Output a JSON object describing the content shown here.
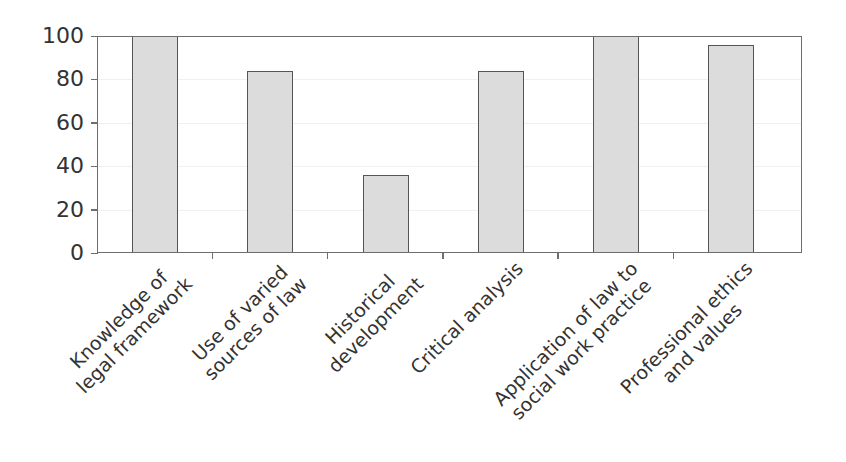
{
  "chart_data": {
    "type": "bar",
    "title": "",
    "xlabel": "",
    "ylabel": "",
    "ylim": [
      0,
      100
    ],
    "yticks": [
      0,
      20,
      40,
      60,
      80,
      100
    ],
    "grid": true,
    "legend": null,
    "categories": [
      "Knowledge of legal framework",
      "Use of varied sources of law",
      "Historical development",
      "Critical analysis",
      "Application of law to social work practice",
      "Professional ethics and values"
    ],
    "category_lines": [
      [
        "Knowledge of",
        "legal framework"
      ],
      [
        "Use of varied",
        "sources of law"
      ],
      [
        "Historical",
        "development"
      ],
      [
        "Critical analysis"
      ],
      [
        "Application of law to",
        "social work practice"
      ],
      [
        "Professional ethics",
        "and values"
      ]
    ],
    "values": [
      100,
      84,
      36,
      84,
      100,
      96
    ],
    "colors": {
      "bar_fill": "#dcdcdc",
      "bar_border": "#555555",
      "axis": "#6e6e6e"
    }
  }
}
